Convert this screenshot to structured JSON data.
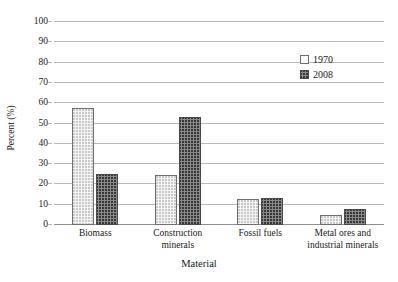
{
  "chart_data": {
    "type": "bar",
    "title": "",
    "xlabel": "Material",
    "ylabel": "Percent (%)",
    "categories": [
      "Biomass",
      "Construction minerals",
      "Fossil fuels",
      "Metal ores and industrial minerals"
    ],
    "category_lines": [
      [
        "Biomass"
      ],
      [
        "Construction",
        "minerals"
      ],
      [
        "Fossil fuels"
      ],
      [
        "Metal ores and",
        "industrial minerals"
      ]
    ],
    "series": [
      {
        "name": "1970",
        "values": [
          57.5,
          24.5,
          13,
          5
        ]
      },
      {
        "name": "2008",
        "values": [
          25,
          53,
          13.5,
          8
        ]
      }
    ],
    "ylim": [
      0,
      100
    ],
    "ytick_step": 10,
    "yticks": [
      "0",
      "10",
      "20",
      "30",
      "40",
      "50",
      "60",
      "70",
      "80",
      "90",
      "100"
    ],
    "grid": true,
    "legend_position": "top-right",
    "colors": {
      "series_1970_fill": "#f4f4f4",
      "series_1970_border": "#6f6f6f",
      "series_2008_fill": "#8a8a8a",
      "series_2008_border": "#4a4a4a",
      "gridline": "#b9b9b9",
      "text": "#1a1a1a"
    }
  },
  "legend": {
    "items": [
      {
        "label": "1970"
      },
      {
        "label": "2008"
      }
    ]
  }
}
